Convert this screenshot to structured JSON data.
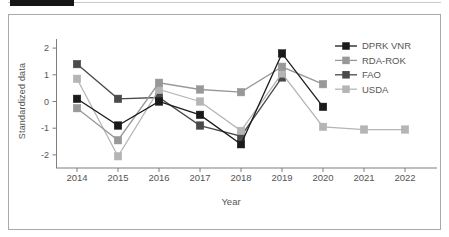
{
  "figure": {
    "panel_border_color": "#a9a9a9",
    "background": "#ffffff"
  },
  "chart_data": {
    "type": "line",
    "title": "",
    "xlabel": "Year",
    "ylabel": "Standardized data",
    "x": [
      2014,
      2015,
      2016,
      2017,
      2018,
      2019,
      2020,
      2021,
      2022
    ],
    "yticks": [
      2,
      1,
      0,
      -1,
      -2
    ],
    "ylim": [
      -2.5,
      2.5
    ],
    "grid": false,
    "legend_position": "top-right",
    "marker": "square",
    "series": [
      {
        "name": "DPRK VNR",
        "color": "#1a1a1a",
        "x": [
          2014,
          2015,
          2016,
          2017,
          2018,
          2019,
          2020
        ],
        "values": [
          0.1,
          -0.9,
          0.0,
          -0.5,
          -1.6,
          1.8,
          -0.2
        ]
      },
      {
        "name": "RDA-ROK",
        "color": "#989898",
        "x": [
          2014,
          2015,
          2016,
          2017,
          2018,
          2019,
          2020
        ],
        "values": [
          -0.25,
          -1.45,
          0.7,
          0.45,
          0.35,
          1.3,
          0.65
        ]
      },
      {
        "name": "FAO",
        "color": "#4a4a4a",
        "x": [
          2014,
          2015,
          2016,
          2017,
          2018,
          2019
        ],
        "values": [
          1.4,
          0.1,
          0.15,
          -0.9,
          -1.3,
          0.9
        ]
      },
      {
        "name": "USDA",
        "color": "#b5b5b5",
        "x": [
          2014,
          2015,
          2016,
          2017,
          2018,
          2019,
          2020,
          2021,
          2022
        ],
        "values": [
          0.85,
          -2.05,
          0.45,
          0.0,
          -1.1,
          1.05,
          -0.95,
          -1.05,
          -1.05
        ]
      }
    ]
  }
}
